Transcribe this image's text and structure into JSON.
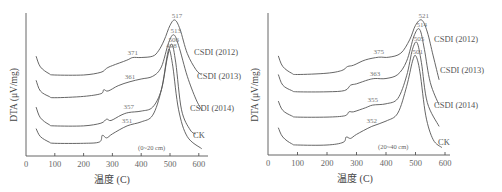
{
  "chart_data": [
    {
      "type": "line",
      "title": "",
      "panel_label": "(0~20 cm)",
      "xlabel": "温度 (C)",
      "ylabel": "DTA (μV/mg)",
      "xlim": [
        0,
        630
      ],
      "xticks": [
        0,
        100,
        200,
        300,
        400,
        500,
        600
      ],
      "yticks": [],
      "grid": false,
      "legend_position": "inline-right",
      "series": [
        {
          "name": "CSDI (2012)",
          "shoulder_peak_C": 371,
          "main_peak_C": 517,
          "x": [
            35,
            50,
            80,
            100,
            200,
            260,
            280,
            300,
            350,
            371,
            400,
            440,
            460,
            480,
            500,
            517,
            535,
            560,
            590,
            610
          ],
          "y": [
            0.7,
            0.62,
            0.57,
            0.56,
            0.56,
            0.58,
            0.61,
            0.63,
            0.67,
            0.69,
            0.69,
            0.7,
            0.74,
            0.82,
            0.93,
            0.97,
            0.9,
            0.72,
            0.6,
            0.56
          ]
        },
        {
          "name": "CSDI (2013)",
          "shoulder_peak_C": 361,
          "main_peak_C": 513,
          "x": [
            35,
            50,
            80,
            100,
            200,
            260,
            270,
            285,
            320,
            361,
            400,
            440,
            470,
            495,
            513,
            530,
            560,
            590,
            610
          ],
          "y": [
            0.52,
            0.44,
            0.4,
            0.39,
            0.4,
            0.42,
            0.45,
            0.44,
            0.48,
            0.51,
            0.53,
            0.55,
            0.62,
            0.8,
            0.86,
            0.78,
            0.55,
            0.38,
            0.3
          ]
        },
        {
          "name": "CSDI (2014)",
          "shoulder_peak_C": 357,
          "main_peak_C": 506,
          "x": [
            35,
            50,
            80,
            100,
            200,
            260,
            280,
            295,
            330,
            357,
            400,
            440,
            470,
            490,
            506,
            520,
            540,
            570,
            590
          ],
          "y": [
            0.32,
            0.24,
            0.19,
            0.18,
            0.18,
            0.2,
            0.23,
            0.22,
            0.26,
            0.28,
            0.29,
            0.32,
            0.45,
            0.68,
            0.79,
            0.65,
            0.3,
            0.15,
            0.12
          ]
        },
        {
          "name": "CK",
          "shoulder_peak_C": 351,
          "main_peak_C": 498,
          "x": [
            35,
            50,
            80,
            100,
            200,
            255,
            265,
            280,
            300,
            351,
            400,
            440,
            470,
            490,
            498,
            510,
            530,
            560,
            610
          ],
          "y": [
            0.16,
            0.1,
            0.06,
            0.05,
            0.05,
            0.06,
            0.11,
            0.09,
            0.12,
            0.18,
            0.21,
            0.26,
            0.45,
            0.7,
            0.75,
            0.62,
            0.3,
            0.1,
            0.01
          ]
        }
      ]
    },
    {
      "type": "line",
      "title": "",
      "panel_label": "(20~40 cm)",
      "xlabel": "温度 (C)",
      "ylabel": "DTA (μV/mg)",
      "xlim": [
        0,
        620
      ],
      "xticks": [
        0,
        100,
        200,
        300,
        400,
        500,
        600
      ],
      "yticks": [],
      "grid": false,
      "legend_position": "inline-right",
      "series": [
        {
          "name": "CSDI (2012)",
          "shoulder_peak_C": 375,
          "main_peak_C": 521,
          "x": [
            35,
            50,
            80,
            100,
            200,
            250,
            270,
            290,
            330,
            375,
            410,
            450,
            480,
            500,
            521,
            540,
            560,
            580
          ],
          "y": [
            0.7,
            0.62,
            0.57,
            0.56,
            0.57,
            0.59,
            0.62,
            0.63,
            0.67,
            0.69,
            0.69,
            0.72,
            0.82,
            0.93,
            0.97,
            0.88,
            0.7,
            0.52
          ]
        },
        {
          "name": "CSDI (2013)",
          "shoulder_peak_C": 363,
          "main_peak_C": 514,
          "x": [
            35,
            50,
            80,
            100,
            200,
            260,
            280,
            300,
            340,
            363,
            400,
            440,
            470,
            495,
            514,
            530,
            550,
            580
          ],
          "y": [
            0.56,
            0.48,
            0.44,
            0.43,
            0.43,
            0.44,
            0.48,
            0.49,
            0.52,
            0.53,
            0.53,
            0.56,
            0.66,
            0.85,
            0.9,
            0.75,
            0.5,
            0.33
          ]
        },
        {
          "name": "CSDI (2014)",
          "shoulder_peak_C": 355,
          "main_peak_C": 505,
          "x": [
            35,
            50,
            80,
            100,
            200,
            260,
            275,
            290,
            330,
            355,
            400,
            440,
            470,
            490,
            505,
            520,
            540,
            580
          ],
          "y": [
            0.36,
            0.29,
            0.25,
            0.24,
            0.24,
            0.25,
            0.28,
            0.28,
            0.31,
            0.33,
            0.34,
            0.38,
            0.55,
            0.75,
            0.8,
            0.65,
            0.35,
            0.17
          ]
        },
        {
          "name": "CK",
          "shoulder_peak_C": 352,
          "main_peak_C": 501,
          "x": [
            35,
            50,
            80,
            100,
            200,
            255,
            265,
            280,
            300,
            352,
            400,
            440,
            470,
            490,
            501,
            515,
            535,
            560,
            590
          ],
          "y": [
            0.16,
            0.09,
            0.04,
            0.03,
            0.03,
            0.05,
            0.09,
            0.08,
            0.11,
            0.17,
            0.21,
            0.27,
            0.47,
            0.66,
            0.7,
            0.58,
            0.25,
            0.07,
            0.01
          ]
        }
      ]
    }
  ]
}
